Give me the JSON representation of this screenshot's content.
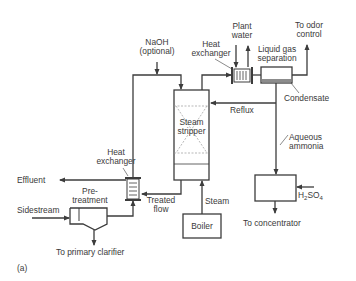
{
  "diagram": {
    "type": "process-flow-diagram",
    "figure_label": "(a)",
    "colors": {
      "line": "#3c3c3c",
      "text": "#3a3a3a",
      "background": "#ffffff",
      "dashed": "#9a9a9a",
      "liquid": "#8c8c8c"
    },
    "units": {
      "steam_stripper": {
        "label_line1": "Steam",
        "label_line2": "stripper"
      },
      "boiler": {
        "label": "Boiler"
      },
      "heat_exchanger_top": {
        "label_line1": "Heat",
        "label_line2": "exchanger"
      },
      "heat_exchanger_bottom": {
        "label_line1": "Heat",
        "label_line2": "exchanger"
      },
      "liquid_gas_separation": {
        "label_line1": "Liquid gas",
        "label_line2": "separation"
      },
      "pretreatment": {
        "label_line1": "Pre-",
        "label_line2": "treatment"
      },
      "acid_tank": {
        "reagent_prefix": "H",
        "reagent_sub1": "2",
        "reagent_mid": "SO",
        "reagent_sub2": "4"
      }
    },
    "streams": {
      "naoh_line1": "NaOH",
      "naoh_line2": "(optional)",
      "plant_water_line1": "Plant",
      "plant_water_line2": "water",
      "odor_line1": "To odor",
      "odor_line2": "control",
      "condensate": "Condensate",
      "reflux": "Reflux",
      "aqueous_ammonia_line1": "Aqueous",
      "aqueous_ammonia_line2": "ammonia",
      "effluent": "Effluent",
      "sidestream": "Sidestream",
      "treated_flow_line1": "Treated",
      "treated_flow_line2": "flow",
      "steam": "Steam",
      "to_primary_clarifier": "To primary clarifier",
      "to_concentrator": "To concentrator"
    }
  }
}
